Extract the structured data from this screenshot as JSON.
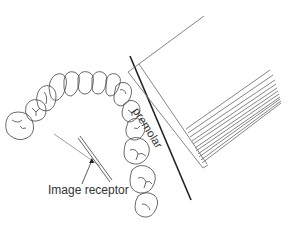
{
  "diagram": {
    "labels": {
      "image_receptor": "Image receptor",
      "premolar": "premolar"
    },
    "elements": [
      {
        "name": "dental-arch",
        "description": "Maxillary arch, occlusal view, outline drawing of teeth"
      },
      {
        "name": "image-receptor",
        "description": "Thin double-line bar placed lingual to premolars"
      },
      {
        "name": "central-ray",
        "description": "Thin line from receptor through premolar contact"
      },
      {
        "name": "position-indicating-device",
        "description": "Rectangular cone/PID with stacked rim lines, angled toward premolar region"
      },
      {
        "name": "beam-line",
        "description": "Bold dark line parallel to cone edge"
      }
    ],
    "colors": {
      "line": "#555555",
      "bold_line": "#222222",
      "text": "#333333",
      "background": "#ffffff"
    }
  }
}
